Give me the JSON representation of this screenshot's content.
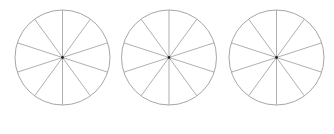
{
  "figure": {
    "stroke_color": "#a6a6a6",
    "center_dot_color": "#222222",
    "circles": [
      {
        "id": "circle-1",
        "cx": 62.5,
        "cy": 57.5,
        "r": 47.5,
        "sectors": 10
      },
      {
        "id": "circle-2",
        "cx": 169,
        "cy": 57.5,
        "r": 47.5,
        "sectors": 10
      },
      {
        "id": "circle-3",
        "cx": 276.5,
        "cy": 57.5,
        "r": 47.5,
        "sectors": 10
      }
    ],
    "diameter_angles_deg": [
      18,
      54,
      90,
      126,
      162
    ]
  }
}
